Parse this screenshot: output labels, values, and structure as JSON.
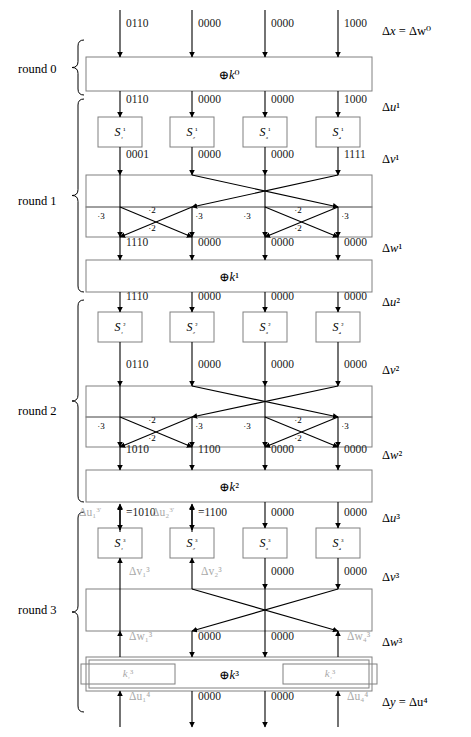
{
  "figure": {
    "columns": 4,
    "column_x": [
      120,
      192,
      265,
      338
    ],
    "colors": {
      "line": "#000000",
      "box_border": "#808080",
      "faded_text": "#a9a9a9",
      "text": "#000000",
      "background": "#ffffff"
    }
  },
  "round_labels": [
    {
      "name": "round-0",
      "text": "round 0"
    },
    {
      "name": "round-1",
      "text": "round 1"
    },
    {
      "name": "round-2",
      "text": "round 2"
    },
    {
      "name": "round-3",
      "text": "round 3"
    }
  ],
  "side_labels": [
    {
      "name": "delta-x-w0",
      "html": "Δx = Δw⁰",
      "y": 32
    },
    {
      "name": "delta-u1",
      "html": "Δu¹",
      "y": 108
    },
    {
      "name": "delta-v1",
      "html": "Δv¹",
      "y": 160
    },
    {
      "name": "delta-w1",
      "html": "Δw¹",
      "y": 249
    },
    {
      "name": "delta-u2",
      "html": "Δu²",
      "y": 303
    },
    {
      "name": "delta-v2",
      "html": "Δv²",
      "y": 371
    },
    {
      "name": "delta-w2",
      "html": "Δw²",
      "y": 456
    },
    {
      "name": "delta-u3",
      "html": "Δu³",
      "y": 519
    },
    {
      "name": "delta-v3",
      "html": "Δv³",
      "y": 578
    },
    {
      "name": "delta-w3",
      "html": "Δw³",
      "y": 643
    },
    {
      "name": "delta-y-u4",
      "html": "Δy = Δu⁴",
      "y": 703
    }
  ],
  "xor_boxes": [
    {
      "name": "xor-k0",
      "label": "⊕k⁰",
      "y": 57,
      "height": 34
    },
    {
      "name": "xor-k1",
      "label": "⊕k¹",
      "y": 260,
      "height": 32
    },
    {
      "name": "xor-k2",
      "label": "⊕k²",
      "y": 470,
      "height": 32
    },
    {
      "name": "xor-k3",
      "label": "⊕k³",
      "y": 657,
      "height": 34
    }
  ],
  "key_subboxes": [
    {
      "name": "key-subbox-k1-3",
      "label": "k₁³",
      "col": 1
    },
    {
      "name": "key-subbox-k4-3",
      "label": "k₄³",
      "col": 4
    }
  ],
  "sbox_rows": [
    {
      "name": "sbox-row-1",
      "y": 117,
      "labels": [
        "S₁¹",
        "S₂¹",
        "S₃¹",
        "S₄¹"
      ],
      "faded": [
        false,
        false,
        false,
        false
      ]
    },
    {
      "name": "sbox-row-2",
      "y": 312,
      "labels": [
        "S₁²",
        "S₂²",
        "S₃²",
        "S₄²"
      ],
      "faded": [
        false,
        false,
        false,
        false
      ]
    },
    {
      "name": "sbox-row-3",
      "y": 528,
      "labels": [
        "S₁³",
        "S₂³",
        "S₃³",
        "S₄³"
      ],
      "faded": [
        false,
        false,
        false,
        false
      ]
    }
  ],
  "bit_rows": [
    {
      "name": "bits-delta-x",
      "y": 24,
      "values": [
        "0110",
        "0000",
        "0000",
        "1000"
      ],
      "faded": [
        false,
        false,
        false,
        false
      ]
    },
    {
      "name": "bits-delta-u1",
      "y": 100,
      "values": [
        "0110",
        "0000",
        "0000",
        "1000"
      ],
      "faded": [
        false,
        false,
        false,
        false
      ]
    },
    {
      "name": "bits-delta-v1",
      "y": 155,
      "values": [
        "0001",
        "0000",
        "0000",
        "1111"
      ],
      "faded": [
        false,
        false,
        false,
        false
      ]
    },
    {
      "name": "bits-delta-w1",
      "y": 243,
      "values": [
        "1110",
        "0000",
        "0000",
        "0000"
      ],
      "faded": [
        false,
        false,
        false,
        false
      ]
    },
    {
      "name": "bits-delta-u2",
      "y": 297,
      "values": [
        "1110",
        "0000",
        "0000",
        "0000"
      ],
      "faded": [
        false,
        false,
        false,
        false
      ]
    },
    {
      "name": "bits-delta-v2",
      "y": 365,
      "values": [
        "0110",
        "0000",
        "0000",
        "0000"
      ],
      "faded": [
        false,
        false,
        false,
        false
      ]
    },
    {
      "name": "bits-delta-w2",
      "y": 450,
      "values": [
        "1010",
        "1100",
        "0000",
        "0000"
      ],
      "faded": [
        false,
        false,
        false,
        false
      ]
    },
    {
      "name": "bits-delta-u3",
      "y": 513,
      "values": [
        "=1010",
        "=1100",
        "0000",
        "0000"
      ],
      "faded": [
        false,
        false,
        false,
        false
      ]
    },
    {
      "name": "bits-delta-v3",
      "y": 572,
      "values": [
        "",
        "",
        "0000",
        "0000"
      ],
      "faded": [
        false,
        false,
        false,
        false
      ]
    },
    {
      "name": "bits-delta-w3",
      "y": 637,
      "values": [
        "",
        "0000",
        "0000",
        ""
      ],
      "faded": [
        false,
        false,
        false,
        false
      ]
    },
    {
      "name": "bits-delta-u4",
      "y": 697,
      "values": [
        "",
        "0000",
        "0000",
        ""
      ],
      "faded": [
        false,
        false,
        false,
        false
      ]
    }
  ],
  "unknown_labels": [
    {
      "name": "unknown-delta-u1-3prime",
      "html": "Δu₁<sup>3′</sup>",
      "x": 79,
      "y": 513
    },
    {
      "name": "unknown-delta-u2-3prime",
      "html": "Δu₂<sup>3′</sup>",
      "x": 152,
      "y": 513
    },
    {
      "name": "unknown-delta-v1-3",
      "html": "Δv₁³",
      "x": 129,
      "y": 572
    },
    {
      "name": "unknown-delta-v2-3",
      "html": "Δv₂³",
      "x": 201,
      "y": 572
    },
    {
      "name": "unknown-delta-w1-3",
      "html": "Δw₁³",
      "x": 129,
      "y": 637
    },
    {
      "name": "unknown-delta-w4-3",
      "html": "Δw₄³",
      "x": 347,
      "y": 637
    },
    {
      "name": "unknown-delta-u1-4",
      "html": "Δu₁⁴",
      "x": 129,
      "y": 697
    },
    {
      "name": "unknown-delta-u4-4",
      "html": "Δu₄⁴",
      "x": 347,
      "y": 697
    }
  ],
  "mix_layers": [
    {
      "name": "mix-layer-round-1",
      "top": 175,
      "mid": 207,
      "bottom": 237,
      "multipliers": [
        {
          "name": "mult-3-col1",
          "text": "·3",
          "x": 101,
          "y": 216
        },
        {
          "name": "mult-2-upper-left",
          "text": "·2",
          "x": 152,
          "y": 210
        },
        {
          "name": "mult-2-lower-left",
          "text": "·2",
          "x": 152,
          "y": 228
        },
        {
          "name": "mult-3-col2",
          "text": "·3",
          "x": 199,
          "y": 216
        },
        {
          "name": "mult-3-col3",
          "text": "·3",
          "x": 247,
          "y": 216
        },
        {
          "name": "mult-2-upper-right",
          "text": "·2",
          "x": 298,
          "y": 210
        },
        {
          "name": "mult-2-lower-right",
          "text": "·2",
          "x": 298,
          "y": 228
        },
        {
          "name": "mult-3-col4",
          "text": "·3",
          "x": 345,
          "y": 216
        }
      ]
    },
    {
      "name": "mix-layer-round-2",
      "top": 386,
      "mid": 417,
      "bottom": 447,
      "multipliers": [
        {
          "name": "mult-3-col1",
          "text": "·3",
          "x": 101,
          "y": 426
        },
        {
          "name": "mult-2-upper-left",
          "text": "·2",
          "x": 152,
          "y": 420
        },
        {
          "name": "mult-2-lower-left",
          "text": "·2",
          "x": 152,
          "y": 438
        },
        {
          "name": "mult-3-col2",
          "text": "·3",
          "x": 199,
          "y": 426
        },
        {
          "name": "mult-3-col3",
          "text": "·3",
          "x": 247,
          "y": 426
        },
        {
          "name": "mult-2-upper-right",
          "text": "·2",
          "x": 298,
          "y": 420
        },
        {
          "name": "mult-2-lower-right",
          "text": "·2",
          "x": 298,
          "y": 438
        },
        {
          "name": "mult-3-col4",
          "text": "·3",
          "x": 345,
          "y": 426
        }
      ]
    },
    {
      "name": "mix-layer-round-3",
      "top": 589,
      "mid": 631,
      "bottom": 631,
      "multipliers": []
    }
  ]
}
